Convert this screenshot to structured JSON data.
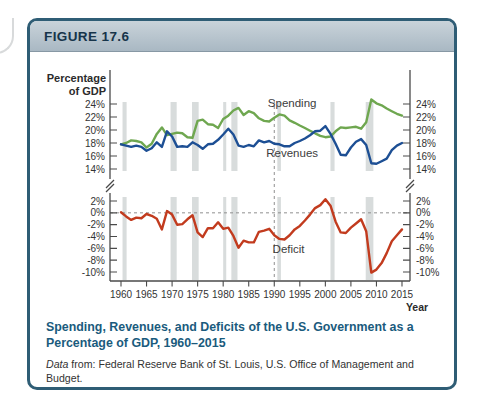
{
  "figure": {
    "label": "FIGURE 17.6"
  },
  "caption": {
    "title": "Spending, Revenues, and Deficits of the U.S. Government as a Percentage of GDP, 1960–2015",
    "source_prefix": "Data",
    "source_rest": " from: Federal Reserve Bank of St. Louis, U.S. Office of Management and Budget.",
    "source_url": "fred.stlouisfed.org"
  },
  "colors": {
    "spending_green": "#6fa750",
    "revenues_blue": "#1d4f94",
    "deficit_red": "#c23b1e",
    "recession_gray": "#d8dcdc",
    "axis_gray": "#4a4a4a",
    "dash_gray": "#8f8f8f",
    "caption_teal": "#1a5b7d",
    "border_teal": "#2f5d75"
  },
  "chart_data": {
    "type": "line",
    "title": "Spending, Revenues, and Deficits of the U.S. Government as a Percentage of GDP, 1960–2015",
    "xlabel": "Year",
    "ylabel": "Percentage of GDP",
    "ylabel_lines": [
      "Percentage",
      "of GDP"
    ],
    "xlim": [
      1960,
      2015
    ],
    "xticks": [
      1960,
      1965,
      1970,
      1975,
      1980,
      1985,
      1990,
      1995,
      2000,
      2005,
      2010,
      2015
    ],
    "grid": false,
    "axis_break": true,
    "dashed_vline_year": 1990,
    "x": [
      1960,
      1961,
      1962,
      1963,
      1964,
      1965,
      1966,
      1967,
      1968,
      1969,
      1970,
      1971,
      1972,
      1973,
      1974,
      1975,
      1976,
      1977,
      1978,
      1979,
      1980,
      1981,
      1982,
      1983,
      1984,
      1985,
      1986,
      1987,
      1988,
      1989,
      1990,
      1991,
      1992,
      1993,
      1994,
      1995,
      1996,
      1997,
      1998,
      1999,
      2000,
      2001,
      2002,
      2003,
      2004,
      2005,
      2006,
      2007,
      2008,
      2009,
      2010,
      2011,
      2012,
      2013,
      2014,
      2015
    ],
    "panels": [
      {
        "name": "top",
        "yticks": [
          24,
          22,
          20,
          18,
          16,
          14
        ],
        "ylim": [
          13.5,
          25.5
        ],
        "series": [
          {
            "name": "Spending",
            "color_key": "spending_green",
            "values": [
              17.8,
              18.0,
              18.4,
              18.3,
              18.1,
              17.3,
              17.9,
              19.4,
              20.4,
              19.2,
              19.4,
              19.6,
              19.5,
              18.9,
              18.8,
              21.4,
              21.6,
              20.9,
              20.8,
              20.3,
              21.7,
              22.2,
              23.0,
              23.4,
              22.3,
              22.9,
              22.6,
              21.8,
              21.4,
              21.3,
              21.9,
              22.4,
              22.2,
              21.5,
              21.1,
              20.7,
              20.3,
              19.9,
              19.5,
              19.1,
              18.9,
              19.0,
              19.8,
              20.4,
              20.3,
              20.4,
              20.5,
              20.2,
              21.2,
              24.7,
              24.1,
              23.8,
              23.3,
              22.9,
              22.5,
              22.2
            ]
          },
          {
            "name": "Revenues",
            "color_key": "revenues_blue",
            "values": [
              17.8,
              17.6,
              17.4,
              17.6,
              17.4,
              16.8,
              17.2,
              18.1,
              17.4,
              19.8,
              19.0,
              17.4,
              17.5,
              17.4,
              18.1,
              17.7,
              17.1,
              17.8,
              17.9,
              18.5,
              19.3,
              20.2,
              19.3,
              17.6,
              17.4,
              17.7,
              17.5,
              18.4,
              18.1,
              18.3,
              17.9,
              17.8,
              17.5,
              17.5,
              18.0,
              18.3,
              18.7,
              19.2,
              19.8,
              19.9,
              20.6,
              19.4,
              17.9,
              16.2,
              16.1,
              17.3,
              18.2,
              18.6,
              17.7,
              14.9,
              14.8,
              15.2,
              15.6,
              16.9,
              17.6,
              18.0
            ]
          }
        ]
      },
      {
        "name": "bottom",
        "yticks": [
          2,
          0,
          -2,
          -4,
          -6,
          -8,
          -10
        ],
        "ylim": [
          -10.8,
          2.6
        ],
        "zero_dashed": true,
        "series": [
          {
            "name": "Deficit",
            "color_key": "deficit_red",
            "values": [
              0.1,
              -0.6,
              -1.2,
              -0.8,
              -0.9,
              -0.2,
              -0.5,
              -1.0,
              -2.8,
              0.3,
              -0.3,
              -2.0,
              -1.9,
              -1.1,
              -0.4,
              -3.3,
              -4.1,
              -2.6,
              -2.6,
              -1.6,
              -2.7,
              -2.5,
              -3.9,
              -5.9,
              -4.7,
              -5.0,
              -5.0,
              -3.2,
              -3.0,
              -2.7,
              -3.8,
              -4.4,
              -4.5,
              -3.8,
              -2.8,
              -2.2,
              -1.3,
              -0.3,
              0.8,
              1.3,
              2.3,
              1.2,
              -1.5,
              -3.3,
              -3.4,
              -2.5,
              -1.8,
              -1.1,
              -3.1,
              -10.1,
              -9.6,
              -8.5,
              -6.8,
              -4.8,
              -3.8,
              -2.8
            ]
          }
        ]
      }
    ],
    "recessions": [
      [
        1960.3,
        1961.1
      ],
      [
        1969.7,
        1970.9
      ],
      [
        1973.9,
        1975.2
      ],
      [
        1980.0,
        1980.6
      ],
      [
        1981.6,
        1982.8
      ],
      [
        1990.6,
        1991.3
      ],
      [
        2001.0,
        2001.8
      ],
      [
        2007.9,
        2009.4
      ]
    ],
    "annotations": [
      {
        "text": "Spending",
        "panel": "top",
        "cx_year": 1993.5,
        "baseline_value_px": 55
      },
      {
        "text": "Revenues",
        "panel": "top",
        "cx_year": 1993.5,
        "baseline_value_px": 105
      },
      {
        "text": "Deficit",
        "panel": "bottom",
        "cx_year": 1992.8,
        "baseline_value_px": 201
      }
    ]
  }
}
